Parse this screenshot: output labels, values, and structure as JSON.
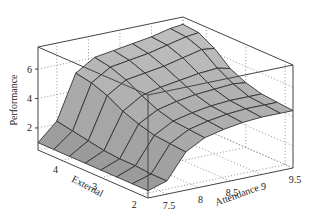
{
  "chart_data": {
    "type": "surface3d",
    "title": "",
    "xlabel": "Attendance",
    "ylabel": "External",
    "zlabel": "Performance",
    "x_ticks": [
      "7.5",
      "8",
      "8.5",
      "9",
      "9.5"
    ],
    "y_ticks": [
      "4",
      "3",
      "2"
    ],
    "z_ticks": [
      "2",
      "4",
      "6"
    ],
    "x_range": [
      7.2,
      9.5
    ],
    "y_range": [
      1.8,
      4.6
    ],
    "z_range": [
      0.5,
      7.5
    ],
    "grid": true,
    "surface_color": "#a8a8a8",
    "mesh_color": "#333333",
    "x": [
      7.2,
      7.5,
      7.8,
      8.1,
      8.4,
      8.7,
      9.0,
      9.3,
      9.5
    ],
    "y": [
      4.6,
      4.2,
      3.8,
      3.4,
      3.0,
      2.6,
      2.2,
      1.8
    ],
    "z": [
      [
        1.0,
        2.2,
        5.2,
        6.0,
        6.2,
        6.4,
        6.6,
        6.9,
        7.0
      ],
      [
        1.0,
        2.0,
        5.0,
        5.8,
        6.0,
        6.2,
        6.5,
        6.8,
        6.9
      ],
      [
        1.0,
        1.8,
        4.6,
        5.4,
        5.6,
        5.8,
        6.1,
        6.4,
        6.3
      ],
      [
        1.0,
        1.6,
        4.0,
        4.8,
        5.1,
        5.3,
        5.5,
        5.6,
        5.4
      ],
      [
        1.0,
        1.5,
        3.6,
        4.3,
        4.6,
        4.8,
        4.9,
        5.0,
        4.9
      ],
      [
        1.0,
        1.5,
        3.3,
        4.0,
        4.3,
        4.5,
        4.6,
        4.6,
        4.6
      ],
      [
        1.0,
        1.4,
        3.2,
        3.9,
        4.2,
        4.4,
        4.5,
        4.5,
        4.5
      ],
      [
        1.0,
        1.4,
        3.1,
        3.8,
        4.1,
        4.3,
        4.4,
        4.4,
        4.4
      ]
    ]
  }
}
